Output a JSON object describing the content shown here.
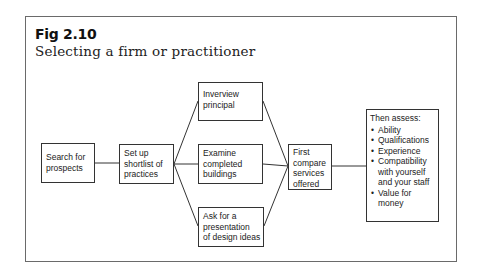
{
  "figure": {
    "number": "Fig 2.10",
    "title": "Selecting a firm or practitioner"
  },
  "nodes": {
    "search": {
      "lines": [
        "Search for",
        "prospects"
      ]
    },
    "shortlist": {
      "lines": [
        "Set up",
        "shortlist of",
        "practices"
      ]
    },
    "interview": {
      "lines": [
        "Inverview",
        "principal"
      ]
    },
    "examine": {
      "lines": [
        "Examine",
        "completed",
        "buildings"
      ]
    },
    "presentation": {
      "lines": [
        "Ask for a",
        "presentation",
        "of design ideas"
      ]
    },
    "compare": {
      "lines": [
        "First",
        "compare",
        "services",
        "offered"
      ]
    },
    "assess": {
      "heading": "Then assess:",
      "items": [
        [
          "Ability"
        ],
        [
          "Qualifications"
        ],
        [
          "Experience"
        ],
        [
          "Compatibility",
          "with yourself",
          "and your staff"
        ],
        [
          "Value for",
          "money"
        ]
      ]
    }
  },
  "edges": [
    {
      "from": "search",
      "to": "shortlist"
    },
    {
      "from": "shortlist",
      "to": "interview"
    },
    {
      "from": "shortlist",
      "to": "examine"
    },
    {
      "from": "shortlist",
      "to": "presentation"
    },
    {
      "from": "interview",
      "to": "compare"
    },
    {
      "from": "examine",
      "to": "compare"
    },
    {
      "from": "presentation",
      "to": "compare"
    },
    {
      "from": "compare",
      "to": "assess"
    }
  ]
}
